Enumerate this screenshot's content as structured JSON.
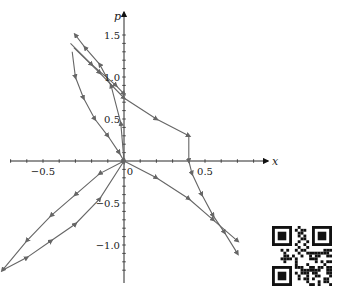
{
  "chart_data": {
    "type": "line",
    "title": "",
    "xlabel": "x",
    "ylabel": "p",
    "xlim": [
      -0.8,
      0.95
    ],
    "ylim": [
      -1.4,
      1.65
    ],
    "grid": false,
    "axes_style": "centered-arrows",
    "x_ticks": [
      {
        "value": -0.5,
        "label": "−0.5"
      },
      {
        "value": 0,
        "label": "0"
      },
      {
        "value": 0.5,
        "label": "0.5"
      }
    ],
    "y_ticks": [
      {
        "value": 1.5,
        "label": "1.5"
      },
      {
        "value": 1.0,
        "label": "1.0"
      },
      {
        "value": 0.5,
        "label": "0.5"
      },
      {
        "value": -0.5,
        "label": "−0.5"
      },
      {
        "value": -1.0,
        "label": "−1.0"
      }
    ],
    "line_color": "#666666",
    "series": [
      {
        "name": "upper-left loop outer",
        "x": [
          0.0,
          -0.02,
          -0.08,
          -0.15,
          -0.24,
          -0.3
        ],
        "y": [
          0.0,
          0.45,
          0.9,
          1.15,
          1.35,
          1.5
        ]
      },
      {
        "name": "upper-left loop inner",
        "x": [
          -0.32,
          -0.3,
          -0.25,
          -0.18,
          -0.1,
          -0.03,
          0.0
        ],
        "y": [
          1.3,
          1.0,
          0.75,
          0.5,
          0.3,
          0.1,
          0.0
        ]
      },
      {
        "name": "upper diagonal 1",
        "x": [
          -0.33,
          -0.2,
          -0.05,
          0.0
        ],
        "y": [
          1.4,
          1.15,
          0.9,
          0.8
        ]
      },
      {
        "name": "upper diagonal 2",
        "x": [
          -0.31,
          -0.15,
          0.0,
          0.2,
          0.4
        ],
        "y": [
          1.35,
          1.05,
          0.75,
          0.5,
          0.3
        ]
      },
      {
        "name": "step down",
        "x": [
          0.4,
          0.4,
          0.42,
          0.48,
          0.55,
          0.62,
          0.7
        ],
        "y": [
          0.3,
          0.0,
          -0.15,
          -0.4,
          -0.65,
          -0.85,
          -1.1
        ]
      },
      {
        "name": "lower right diagonal",
        "x": [
          0.0,
          0.2,
          0.4,
          0.55,
          0.7
        ],
        "y": [
          0.0,
          -0.2,
          -0.45,
          -0.7,
          -0.95
        ]
      },
      {
        "name": "lower-left loop upper",
        "x": [
          0.0,
          -0.15,
          -0.3,
          -0.45,
          -0.6,
          -0.75
        ],
        "y": [
          0.0,
          -0.15,
          -0.4,
          -0.65,
          -0.95,
          -1.3
        ]
      },
      {
        "name": "lower-left loop lower",
        "x": [
          -0.75,
          -0.6,
          -0.45,
          -0.3,
          -0.15,
          0.0
        ],
        "y": [
          -1.3,
          -1.15,
          -0.95,
          -0.75,
          -0.45,
          0.0
        ]
      }
    ]
  },
  "plot": {
    "origin_px": [
      124,
      161
    ],
    "x_scale_px_per_unit": 162,
    "y_scale_px_per_unit": 84
  },
  "qr_code": {
    "present": true
  }
}
